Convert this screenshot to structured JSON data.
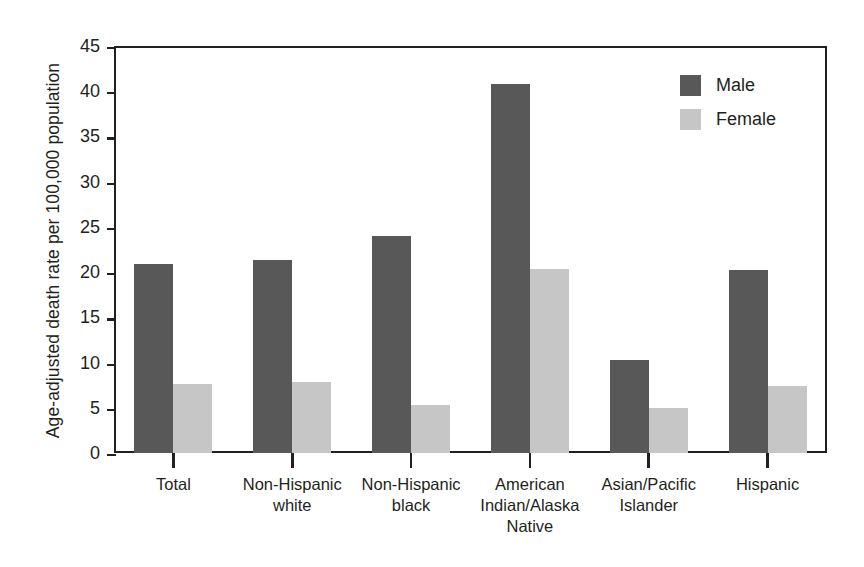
{
  "chart_data": {
    "type": "bar",
    "title": "",
    "xlabel": "",
    "ylabel": "Age-adjusted death rate per 100,000 population",
    "ylim": [
      0,
      45
    ],
    "yticks": [
      0,
      5,
      10,
      15,
      20,
      25,
      30,
      35,
      40,
      45
    ],
    "ytick_labels": [
      "0",
      "5",
      "10",
      "15",
      "20",
      "25",
      "30",
      "35",
      "40",
      "45"
    ],
    "grid": false,
    "legend_position": "top-right",
    "categories": [
      "Total",
      "Non-Hispanic white",
      "Non-Hispanic black",
      "American Indian/Alaska Native",
      "Asian/Pacific Islander",
      "Hispanic"
    ],
    "category_lines": [
      [
        "Total"
      ],
      [
        "Non-Hispanic",
        "white"
      ],
      [
        "Non-Hispanic",
        "black"
      ],
      [
        "American",
        "Indian/Alaska",
        "Native"
      ],
      [
        "Asian/Pacific",
        "Islander"
      ],
      [
        "Hispanic"
      ]
    ],
    "series": [
      {
        "name": "Male",
        "color": "#585858",
        "values": [
          20.9,
          21.3,
          24.0,
          40.8,
          10.3,
          20.2
        ]
      },
      {
        "name": "Female",
        "color": "#c6c6c6",
        "values": [
          7.6,
          7.8,
          5.3,
          20.3,
          5.0,
          7.4
        ]
      }
    ]
  },
  "legend": {
    "items": [
      {
        "label": "Male",
        "color": "#585858"
      },
      {
        "label": "Female",
        "color": "#c6c6c6"
      }
    ]
  },
  "colors": {
    "male": "#585858",
    "female": "#c6c6c6",
    "axis": "#231f20",
    "background": "#ffffff"
  }
}
